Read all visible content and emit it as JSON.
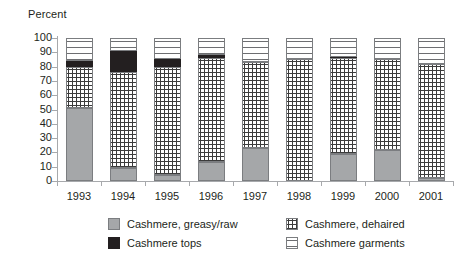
{
  "chart_data": {
    "type": "bar",
    "stacked": true,
    "title": "",
    "subtitle": "",
    "xlabel": "",
    "ylabel": "Percent",
    "ylim": [
      0,
      100
    ],
    "yticks": [
      0,
      10,
      20,
      30,
      40,
      50,
      60,
      70,
      80,
      90,
      100
    ],
    "grid": false,
    "legend_position": "bottom",
    "categories": [
      "1993",
      "1994",
      "1995",
      "1996",
      "1997",
      "1998",
      "1999",
      "2000",
      "2001"
    ],
    "series": [
      {
        "name": "Cashmere, greasy/raw",
        "pattern": "solid-gray",
        "color": "#a5a7a9",
        "values": [
          51,
          9,
          4,
          13,
          23,
          0,
          19,
          22,
          2
        ]
      },
      {
        "name": "Cashmere, dehaired",
        "pattern": "dotted-grid",
        "color": "#ffffff",
        "values": [
          29,
          67,
          76,
          73,
          60,
          85,
          67,
          63,
          80
        ]
      },
      {
        "name": "Cashmere tops",
        "pattern": "solid-black",
        "color": "#231f20",
        "values": [
          4,
          15,
          5,
          2,
          0,
          0,
          1,
          0,
          0
        ]
      },
      {
        "name": "Cashmere garments",
        "pattern": "horizontal-lines",
        "color": "#ffffff",
        "values": [
          16,
          9,
          15,
          12,
          17,
          15,
          13,
          15,
          18
        ]
      }
    ]
  },
  "axis": {
    "y_title": "Percent",
    "y_ticks": [
      "100",
      "90",
      "80",
      "70",
      "60",
      "50",
      "40",
      "30",
      "20",
      "10",
      "0"
    ],
    "x_ticks": [
      "1993",
      "1994",
      "1995",
      "1996",
      "1997",
      "1998",
      "1999",
      "2000",
      "2001"
    ]
  },
  "legend": {
    "items": [
      {
        "label": "Cashmere, greasy/raw",
        "swatch": "solid-gray-swatch"
      },
      {
        "label": "Cashmere, dehaired",
        "swatch": "dotted-grid-swatch"
      },
      {
        "label": "Cashmere tops",
        "swatch": "solid-black-swatch"
      },
      {
        "label": "Cashmere garments",
        "swatch": "horizontal-lines-swatch"
      }
    ]
  }
}
